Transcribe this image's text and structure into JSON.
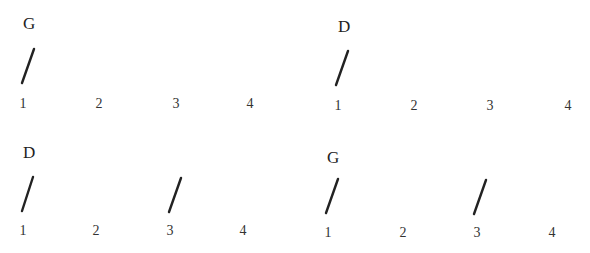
{
  "measures": [
    {
      "chord": "G",
      "strum_beats": [
        1
      ],
      "beats": [
        "1",
        "2",
        "3",
        "4"
      ]
    },
    {
      "chord": "D",
      "strum_beats": [
        1
      ],
      "beats": [
        "1",
        "2",
        "3",
        "4"
      ]
    },
    {
      "chord": "D",
      "strum_beats": [
        1,
        3
      ],
      "beats": [
        "1",
        "2",
        "3",
        "4"
      ]
    },
    {
      "chord": "G",
      "strum_beats": [
        1,
        3
      ],
      "beats": [
        "1",
        "2",
        "3",
        "4"
      ]
    }
  ],
  "strum_symbol": "down-strum-slash"
}
